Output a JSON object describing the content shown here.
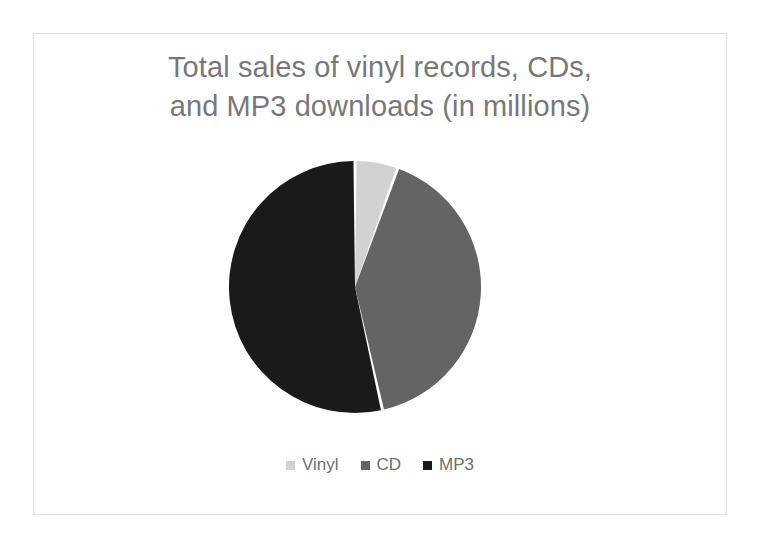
{
  "slide": {
    "background_color": "#ffffff",
    "border_color": "#e3e3e3"
  },
  "chart_data": {
    "type": "pie",
    "title": "Total sales of vinyl records, CDs,\nand MP3 downloads (in millions)",
    "title_color": "#787878",
    "categories": [
      "Vinyl",
      "CD",
      "MP3"
    ],
    "values": [
      5.5,
      41.0,
      53.5
    ],
    "value_unit": "percent of total",
    "start_angle_deg": 0,
    "direction": "clockwise",
    "slice_colors": [
      "#d2d2d2",
      "#646464",
      "#1a1a1a"
    ],
    "slice_gap": true,
    "gap_color": "#ffffff",
    "legend": {
      "position": "bottom",
      "text_color": "#6f6f6f",
      "entries": [
        {
          "label": "Vinyl",
          "color": "#d2d2d2"
        },
        {
          "label": "CD",
          "color": "#646464"
        },
        {
          "label": "MP3",
          "color": "#1a1a1a"
        }
      ]
    },
    "data_labels": false,
    "grid": false
  }
}
